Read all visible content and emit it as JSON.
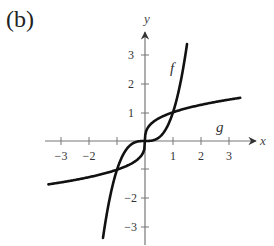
{
  "panel_label": "(b)",
  "chart_data": {
    "type": "line",
    "title": "",
    "xlabel": "x",
    "ylabel": "y",
    "xlim": [
      -3.5,
      3.5
    ],
    "ylim": [
      -3.5,
      3.6
    ],
    "grid": false,
    "x_ticks": [
      -3,
      -2,
      -1,
      1,
      2,
      3
    ],
    "x_tick_labels": [
      "−3",
      "−2",
      "",
      "1",
      "2",
      "3"
    ],
    "y_ticks": [
      -3,
      -2,
      -1,
      1,
      2,
      3
    ],
    "y_tick_labels": [
      "−3",
      "−2",
      "",
      "1",
      "2",
      "3"
    ],
    "series": [
      {
        "name": "f",
        "expression": "f(x) = x^3",
        "x": [
          -1.5,
          -1.25,
          -1,
          -0.75,
          -0.5,
          -0.25,
          0,
          0.25,
          0.5,
          0.75,
          1,
          1.25,
          1.5
        ],
        "values": [
          -3.375,
          -1.953,
          -1,
          -0.422,
          -0.125,
          -0.016,
          0,
          0.016,
          0.125,
          0.422,
          1,
          1.953,
          3.375
        ]
      },
      {
        "name": "g",
        "expression": "g(x) = x^(1/3)",
        "x": [
          -3.45,
          -3,
          -2,
          -1,
          -0.5,
          -0.125,
          0,
          0.125,
          0.5,
          1,
          2,
          3,
          3.4
        ],
        "values": [
          -1.511,
          -1.442,
          -1.26,
          -1,
          -0.794,
          -0.5,
          0,
          0.5,
          0.794,
          1,
          1.26,
          1.442,
          1.504
        ]
      }
    ],
    "annotations": [
      {
        "text": "f",
        "x": 1.1,
        "y": 2.4
      },
      {
        "text": "g",
        "x": 2.5,
        "y": 0.85
      }
    ]
  },
  "labels": {
    "x_axis": "x",
    "y_axis": "y",
    "curve_f": "f",
    "curve_g": "g",
    "xtick_m3": "−3",
    "xtick_m2": "−2",
    "xtick_1": "1",
    "xtick_2": "2",
    "xtick_3": "3",
    "ytick_3": "3",
    "ytick_2": "2",
    "ytick_1": "1",
    "ytick_m2": "−2",
    "ytick_m3": "−3"
  }
}
